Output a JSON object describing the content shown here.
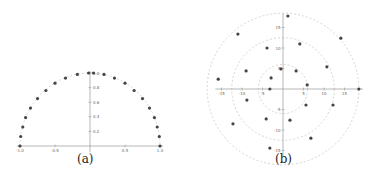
{
  "chart_data": [
    {
      "id": "a",
      "type": "scatter",
      "caption": "(a)",
      "title": "",
      "xlabel": "",
      "ylabel": "",
      "xlim": [
        -1.0,
        1.0
      ],
      "ylim": [
        0,
        1.0
      ],
      "x_ticks": [
        -1.0,
        -0.5,
        0.5,
        1.0
      ],
      "x_tick_labels": [
        "-1.0",
        "-0.5",
        "0.5",
        "1.0"
      ],
      "y_ticks": [
        0.2,
        0.4,
        0.6,
        0.8,
        1.0
      ],
      "y_tick_labels": [
        "0.2",
        "0.4",
        "0.6",
        "0.8",
        "1.0"
      ],
      "grid": false,
      "guide_curve": {
        "shape": "semicircle",
        "radius": 1.0,
        "style": "dashed"
      },
      "points": [
        {
          "x": -1.0,
          "y": 0.0
        },
        {
          "x": -0.99,
          "y": 0.13
        },
        {
          "x": -0.96,
          "y": 0.26
        },
        {
          "x": -0.92,
          "y": 0.39
        },
        {
          "x": -0.85,
          "y": 0.52
        },
        {
          "x": -0.75,
          "y": 0.65
        },
        {
          "x": -0.63,
          "y": 0.76
        },
        {
          "x": -0.5,
          "y": 0.86
        },
        {
          "x": -0.35,
          "y": 0.93
        },
        {
          "x": -0.18,
          "y": 0.98
        },
        {
          "x": -0.02,
          "y": 1.0
        },
        {
          "x": 0.05,
          "y": 1.0
        },
        {
          "x": 0.2,
          "y": 0.98
        },
        {
          "x": 0.35,
          "y": 0.93
        },
        {
          "x": 0.5,
          "y": 0.86
        },
        {
          "x": 0.63,
          "y": 0.76
        },
        {
          "x": 0.75,
          "y": 0.65
        },
        {
          "x": 0.85,
          "y": 0.52
        },
        {
          "x": 0.92,
          "y": 0.39
        },
        {
          "x": 0.96,
          "y": 0.26
        },
        {
          "x": 0.99,
          "y": 0.13
        },
        {
          "x": 1.0,
          "y": 0.0
        }
      ]
    },
    {
      "id": "b",
      "type": "scatter",
      "caption": "(b)",
      "title": "",
      "xlabel": "",
      "ylabel": "",
      "xlim": [
        -16,
        19
      ],
      "ylim": [
        -16,
        18
      ],
      "x_ticks": [
        -15,
        -10,
        -5,
        5,
        10,
        15
      ],
      "x_tick_labels": [
        "-15",
        "-10",
        "-5",
        "5",
        "10",
        "15"
      ],
      "y_ticks": [
        15,
        10,
        5,
        -5,
        -10,
        -15
      ],
      "y_tick_labels": [
        "15",
        "10",
        "5",
        "-5",
        "-10",
        "-15"
      ],
      "grid": false,
      "guide_curves": [
        {
          "shape": "circle",
          "radius": 18.5,
          "style": "dashed"
        },
        {
          "shape": "circle",
          "radius": 12.5,
          "style": "dashed"
        },
        {
          "shape": "circle",
          "radius": 6.0,
          "style": "dashed"
        }
      ],
      "points": [
        {
          "x": 1.2,
          "y": 17.8
        },
        {
          "x": 14.1,
          "y": 12.4
        },
        {
          "x": 18.5,
          "y": 0.0
        },
        {
          "x": -11.0,
          "y": 13.4
        },
        {
          "x": -15.8,
          "y": 2.4
        },
        {
          "x": -12.2,
          "y": -8.5
        },
        {
          "x": -3.2,
          "y": -14.4
        },
        {
          "x": 6.8,
          "y": -12.0
        },
        {
          "x": 4.1,
          "y": 11.0
        },
        {
          "x": -3.9,
          "y": 10.0
        },
        {
          "x": -9.0,
          "y": 4.4
        },
        {
          "x": -8.8,
          "y": -2.7
        },
        {
          "x": 10.7,
          "y": 5.4
        },
        {
          "x": 12.2,
          "y": -3.9
        },
        {
          "x": -4.1,
          "y": -7.3
        },
        {
          "x": 1.7,
          "y": -7.6
        },
        {
          "x": -0.5,
          "y": 4.9
        },
        {
          "x": 3.2,
          "y": 4.4
        },
        {
          "x": -2.9,
          "y": 2.7
        },
        {
          "x": -3.2,
          "y": 0.0
        },
        {
          "x": 5.9,
          "y": 1.0
        },
        {
          "x": 5.6,
          "y": -3.9
        }
      ]
    }
  ],
  "colors": {
    "point": "#444444",
    "axis": "#888888",
    "guide": "#bbbbbb",
    "tick_label": "#666666"
  }
}
